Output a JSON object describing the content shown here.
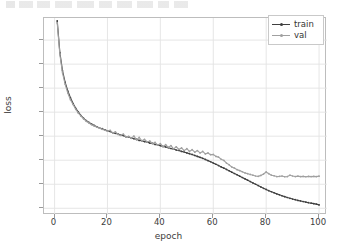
{
  "chart_data": {
    "type": "line",
    "title": "",
    "xlabel": "epoch",
    "ylabel": "loss",
    "xlim": [
      -4,
      103
    ],
    "ylim": [
      -0.07,
      1.98
    ],
    "xticks": [
      0,
      20,
      40,
      60,
      80,
      100
    ],
    "yticks": [
      "0.00",
      "0.25",
      "0.50",
      "0.75",
      "1.00",
      "1.25",
      "1.50",
      "1.75"
    ],
    "ytick_values": [
      0.0,
      0.25,
      0.5,
      0.75,
      1.0,
      1.25,
      1.5,
      1.75
    ],
    "grid": true,
    "legend_position": "upper right",
    "series": [
      {
        "name": "train",
        "color": "#3f3f3f",
        "marker": "dot",
        "x": [
          1,
          2,
          3,
          4,
          5,
          6,
          7,
          8,
          9,
          10,
          11,
          12,
          13,
          14,
          15,
          16,
          17,
          18,
          19,
          20,
          21,
          22,
          23,
          24,
          25,
          26,
          27,
          28,
          29,
          30,
          31,
          32,
          33,
          34,
          35,
          36,
          37,
          38,
          39,
          40,
          41,
          42,
          43,
          44,
          45,
          46,
          47,
          48,
          49,
          50,
          51,
          52,
          53,
          54,
          55,
          56,
          57,
          58,
          59,
          60,
          61,
          62,
          63,
          64,
          65,
          66,
          67,
          68,
          69,
          70,
          71,
          72,
          73,
          74,
          75,
          76,
          77,
          78,
          79,
          80,
          81,
          82,
          83,
          84,
          85,
          86,
          87,
          88,
          89,
          90,
          91,
          92,
          93,
          94,
          95,
          96,
          97,
          98,
          99,
          100
        ],
        "values": [
          1.95,
          1.62,
          1.43,
          1.31,
          1.22,
          1.15,
          1.09,
          1.04,
          1.0,
          0.965,
          0.935,
          0.912,
          0.893,
          0.877,
          0.862,
          0.848,
          0.836,
          0.828,
          0.817,
          0.806,
          0.799,
          0.786,
          0.78,
          0.772,
          0.761,
          0.757,
          0.744,
          0.742,
          0.731,
          0.724,
          0.718,
          0.706,
          0.703,
          0.694,
          0.69,
          0.678,
          0.676,
          0.664,
          0.66,
          0.652,
          0.644,
          0.638,
          0.63,
          0.622,
          0.616,
          0.606,
          0.601,
          0.592,
          0.586,
          0.576,
          0.568,
          0.56,
          0.55,
          0.54,
          0.53,
          0.52,
          0.508,
          0.496,
          0.484,
          0.47,
          0.458,
          0.444,
          0.43,
          0.418,
          0.404,
          0.39,
          0.376,
          0.362,
          0.348,
          0.334,
          0.32,
          0.306,
          0.292,
          0.278,
          0.264,
          0.25,
          0.236,
          0.222,
          0.208,
          0.196,
          0.183,
          0.172,
          0.161,
          0.15,
          0.14,
          0.13,
          0.121,
          0.112,
          0.104,
          0.096,
          0.089,
          0.082,
          0.076,
          0.07,
          0.064,
          0.058,
          0.053,
          0.048,
          0.043,
          0.035
        ]
      },
      {
        "name": "val",
        "color": "#a0a0a0",
        "marker": "dot",
        "x": [
          1,
          2,
          3,
          4,
          5,
          6,
          7,
          8,
          9,
          10,
          11,
          12,
          13,
          14,
          15,
          16,
          17,
          18,
          19,
          20,
          21,
          22,
          23,
          24,
          25,
          26,
          27,
          28,
          29,
          30,
          31,
          32,
          33,
          34,
          35,
          36,
          37,
          38,
          39,
          40,
          41,
          42,
          43,
          44,
          45,
          46,
          47,
          48,
          49,
          50,
          51,
          52,
          53,
          54,
          55,
          56,
          57,
          58,
          59,
          60,
          61,
          62,
          63,
          64,
          65,
          66,
          67,
          68,
          69,
          70,
          71,
          72,
          73,
          74,
          75,
          76,
          77,
          78,
          79,
          80,
          81,
          82,
          83,
          84,
          85,
          86,
          87,
          88,
          89,
          90,
          91,
          92,
          93,
          94,
          95,
          96,
          97,
          98,
          99,
          100
        ],
        "values": [
          1.93,
          1.6,
          1.41,
          1.29,
          1.2,
          1.13,
          1.08,
          1.03,
          0.99,
          0.958,
          0.93,
          0.905,
          0.888,
          0.87,
          0.856,
          0.844,
          0.834,
          0.822,
          0.812,
          0.802,
          0.812,
          0.782,
          0.795,
          0.768,
          0.758,
          0.772,
          0.742,
          0.748,
          0.728,
          0.752,
          0.712,
          0.738,
          0.7,
          0.718,
          0.69,
          0.7,
          0.672,
          0.686,
          0.658,
          0.672,
          0.641,
          0.662,
          0.634,
          0.652,
          0.618,
          0.64,
          0.612,
          0.628,
          0.6,
          0.62,
          0.592,
          0.61,
          0.584,
          0.6,
          0.576,
          0.592,
          0.566,
          0.576,
          0.558,
          0.56,
          0.54,
          0.532,
          0.51,
          0.498,
          0.47,
          0.452,
          0.43,
          0.418,
          0.402,
          0.392,
          0.38,
          0.368,
          0.36,
          0.352,
          0.344,
          0.336,
          0.332,
          0.342,
          0.356,
          0.378,
          0.36,
          0.344,
          0.338,
          0.33,
          0.332,
          0.336,
          0.328,
          0.33,
          0.344,
          0.336,
          0.33,
          0.334,
          0.33,
          0.332,
          0.328,
          0.332,
          0.33,
          0.332,
          0.33,
          0.334
        ]
      }
    ],
    "legend": [
      {
        "label": "train",
        "color": "#3f3f3f"
      },
      {
        "label": "val",
        "color": "#a0a0a0"
      }
    ],
    "notes": {
      "train_final": 0.035,
      "val_final": 0.334,
      "val_plateau": 0.33,
      "divergence_epoch": 62
    }
  }
}
